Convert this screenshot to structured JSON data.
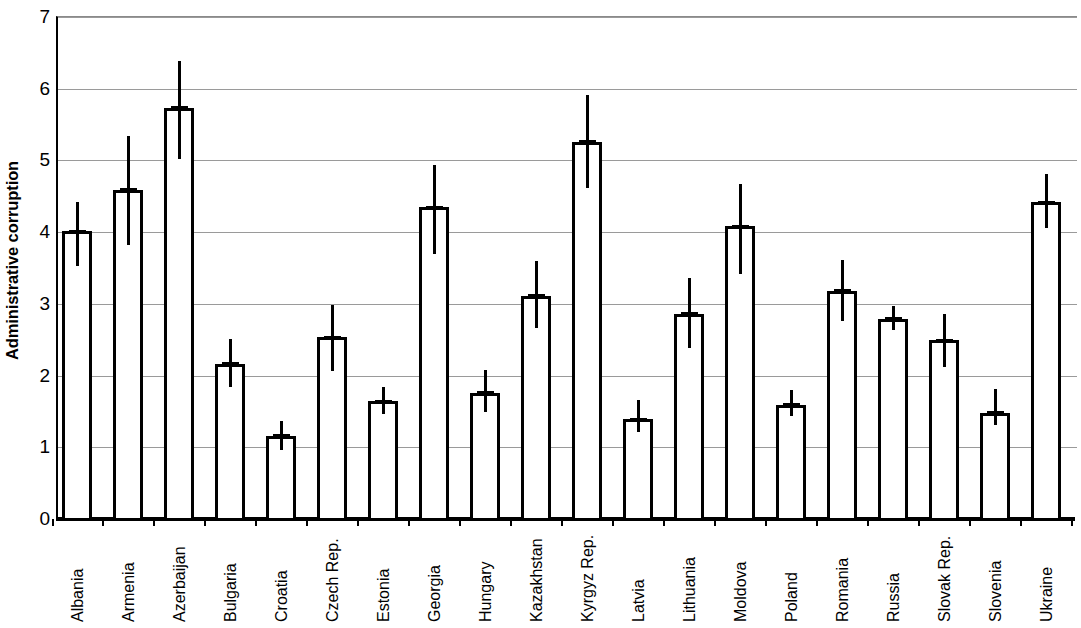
{
  "chart_data": {
    "type": "bar",
    "title": "",
    "xlabel": "",
    "ylabel": "Administrative corruption",
    "ylim": [
      0,
      7
    ],
    "ytick_labels": [
      "0",
      "1",
      "2",
      "3",
      "4",
      "5",
      "6",
      "7"
    ],
    "yticks": [
      0,
      1,
      2,
      3,
      4,
      5,
      6,
      7
    ],
    "grid": true,
    "legend": null,
    "error_bars": true,
    "error_bar_note": "vertical whisker spans low to high around each bar value",
    "categories": [
      "Albania",
      "Armenia",
      "Azerbaijan",
      "Bulgaria",
      "Croatia",
      "Czech Rep.",
      "Estonia",
      "Georgia",
      "Hungary",
      "Kazakhstan",
      "Kyrgyz Rep.",
      "Latvia",
      "Lithuania",
      "Moldova",
      "Poland",
      "Romania",
      "Russia",
      "Slovak Rep.",
      "Slovenia",
      "Ukraine"
    ],
    "values": [
      4.0,
      4.58,
      5.72,
      2.15,
      1.15,
      2.52,
      1.63,
      4.33,
      1.75,
      3.1,
      5.25,
      1.38,
      2.85,
      4.07,
      1.58,
      3.17,
      2.78,
      2.48,
      1.47,
      4.4
    ],
    "err_low": [
      3.52,
      3.8,
      5.0,
      1.82,
      0.95,
      2.05,
      1.45,
      3.68,
      1.48,
      2.65,
      4.6,
      1.2,
      2.37,
      3.4,
      1.42,
      2.75,
      2.62,
      2.1,
      1.3,
      4.05
    ],
    "err_high": [
      4.4,
      5.32,
      6.37,
      2.5,
      1.35,
      2.97,
      1.82,
      4.92,
      2.07,
      3.58,
      5.9,
      1.65,
      3.35,
      4.66,
      1.78,
      3.6,
      2.95,
      2.85,
      1.8,
      4.8
    ]
  }
}
